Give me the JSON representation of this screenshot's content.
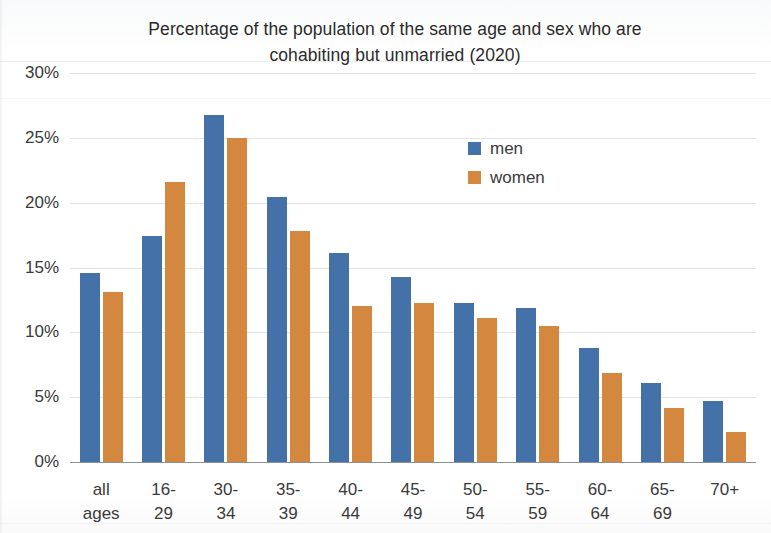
{
  "chart_data": {
    "type": "bar",
    "title": "Percentage of the population of the same age and sex who are cohabiting but unmarried (2020)",
    "title_line1": "Percentage of the population of the same age and sex who are",
    "title_line2": "cohabiting but unmarried (2020)",
    "xlabel": "",
    "ylabel": "",
    "categories": [
      "all\nages",
      "16-29",
      "30-34",
      "35-39",
      "40-44",
      "45-49",
      "50-54",
      "55-59",
      "60-64",
      "65-69",
      "70+"
    ],
    "series": [
      {
        "name": "men",
        "color": "#4472a8",
        "values": [
          14.6,
          17.4,
          26.8,
          20.4,
          16.1,
          14.3,
          12.3,
          11.9,
          8.8,
          6.1,
          4.7
        ]
      },
      {
        "name": "women",
        "color": "#d4883f",
        "values": [
          13.1,
          21.6,
          25.0,
          17.8,
          12.0,
          12.3,
          11.1,
          10.5,
          6.9,
          4.2,
          2.3
        ]
      }
    ],
    "ylim": [
      0,
      30
    ],
    "ytick_values": [
      30,
      25,
      20,
      15,
      10,
      5,
      0
    ],
    "ytick_labels": [
      "30%",
      "25%",
      "20%",
      "15%",
      "10%",
      "5%",
      "0%"
    ],
    "grid": true,
    "legend_position": "upper-right-inside"
  }
}
